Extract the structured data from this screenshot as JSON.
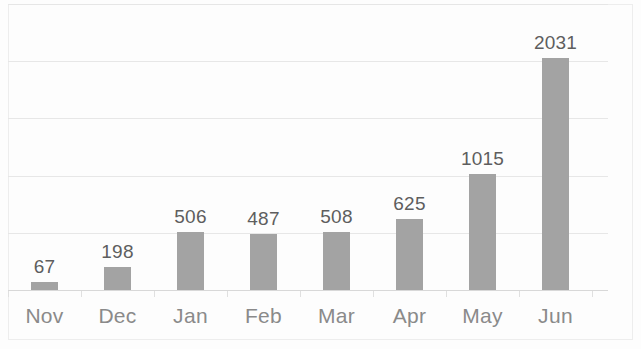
{
  "chart_data": {
    "type": "bar",
    "title": "",
    "subtitle": "",
    "xlabel": "",
    "ylabel": "",
    "categories": [
      "Nov",
      "Dec",
      "Jan",
      "Feb",
      "Mar",
      "Apr",
      "May",
      "Jun"
    ],
    "values": [
      67,
      198,
      506,
      487,
      508,
      625,
      1015,
      2031
    ],
    "value_labels": [
      "67",
      "198",
      "506",
      "487",
      "508",
      "625",
      "1015",
      "2031"
    ],
    "ylim": [
      0,
      2500
    ],
    "y_gridlines": [
      500,
      1000,
      1500,
      2000,
      2500
    ],
    "y_tick_labels_visible": false,
    "grid": true,
    "legend": false,
    "legend_position": "none",
    "data_labels": true,
    "bar_color": "#a3a3a3",
    "label_color": "#5e5e5e",
    "axis_label_color": "#8a8a8a",
    "gridline_color": "#e6e6e6",
    "background_color": "#fdfdfd"
  }
}
